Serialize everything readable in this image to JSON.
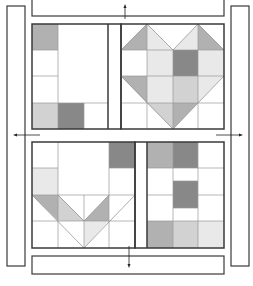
{
  "colors": {
    "background": "#ffffff",
    "outline": "#3a3a3a",
    "grid": "#9a9a9a",
    "dark": "#8c8c8c",
    "medium": "#b4b4b4",
    "light": "#d6d6d6",
    "very_light": "#ececec"
  },
  "sashing": {
    "top": {
      "x": 32,
      "y": 0,
      "w": 192,
      "h": 16
    },
    "bottom": {
      "x": 32,
      "y": 256,
      "w": 192,
      "h": 18
    },
    "left": {
      "x": 7,
      "y": 6,
      "w": 18,
      "h": 260
    },
    "right": {
      "x": 231,
      "y": 6,
      "w": 18,
      "h": 260
    }
  },
  "blocks": [
    {
      "name": "letter-L",
      "x": 32,
      "y": 24,
      "w": 89,
      "h": 105,
      "cells": [
        {
          "x": 32,
          "y": 24,
          "w": 26,
          "h": 26,
          "color": "medium"
        },
        {
          "x": 32,
          "y": 103,
          "w": 26,
          "h": 26,
          "color": "light"
        },
        {
          "x": 58,
          "y": 103,
          "w": 26,
          "h": 26,
          "color": "dark"
        }
      ]
    },
    {
      "name": "heart",
      "x": 121,
      "y": 24,
      "w": 103,
      "h": 105
    },
    {
      "name": "letter-V",
      "x": 32,
      "y": 142,
      "w": 103,
      "h": 106
    },
    {
      "name": "letter-E",
      "x": 135,
      "y": 142,
      "w": 89,
      "h": 106
    }
  ],
  "arrows": [
    {
      "name": "arrow-up-top",
      "direction": "up"
    },
    {
      "name": "arrow-left-middle",
      "direction": "left"
    },
    {
      "name": "arrow-right-middle",
      "direction": "right"
    },
    {
      "name": "arrow-down-bottom",
      "direction": "down"
    }
  ]
}
